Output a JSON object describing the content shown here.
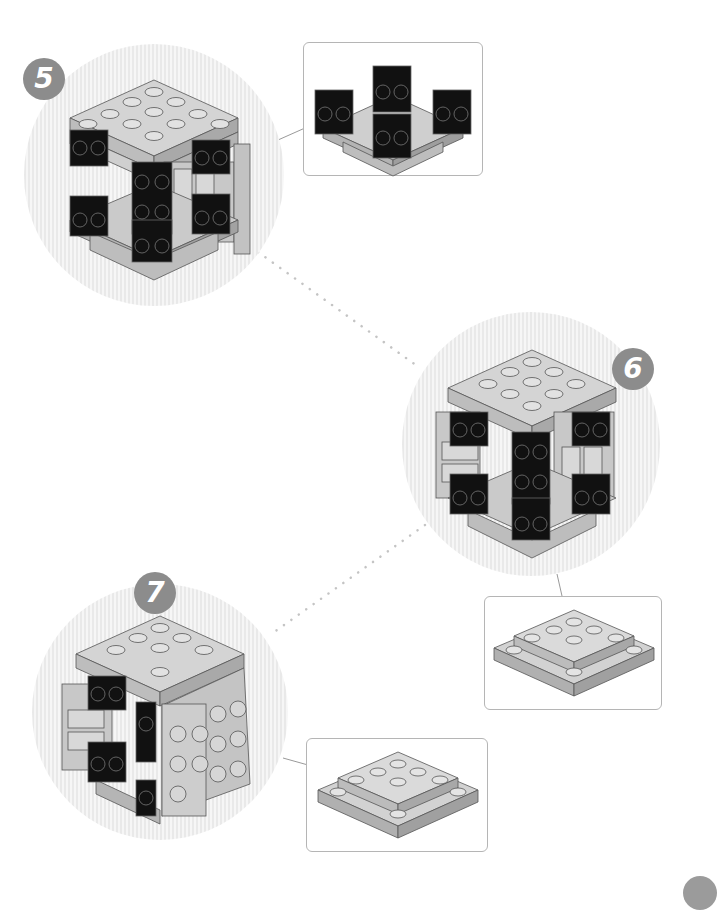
{
  "page": {
    "type": "building-instructions",
    "background": "#ffffff"
  },
  "steps": [
    {
      "number": "5",
      "badge_color": "#8c8c8c",
      "callout": "four black 1x1 bricks with side studs on base ring"
    },
    {
      "number": "6",
      "badge_color": "#8c8c8c",
      "callout": "stepped light-gray plate assembly"
    },
    {
      "number": "7",
      "badge_color": "#8c8c8c",
      "callout": "stepped light-gray plate assembly"
    }
  ],
  "colors": {
    "brick_light": "#d9d9d9",
    "brick_mid": "#bdbdbd",
    "brick_dark": "#9e9e9e",
    "brick_black": "#111111",
    "stripe_a": "#e9e9e9",
    "stripe_b": "#f6f6f6",
    "connector": "#bfbfbf"
  },
  "page_number": ""
}
